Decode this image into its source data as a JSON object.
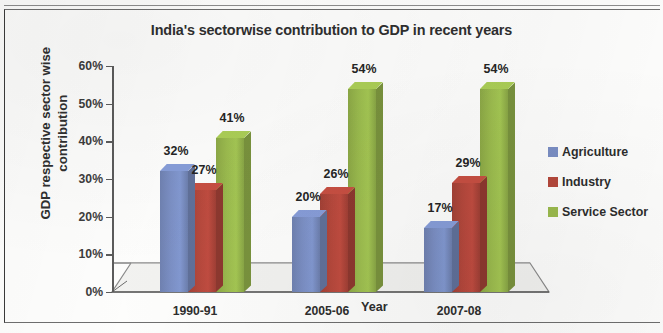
{
  "chart_data": {
    "type": "bar",
    "title": "India's sectorwise contribution to GDP in recent years",
    "xlabel": "Year",
    "ylabel_line1": "GDP respective sector wise",
    "ylabel_line2": "contribution",
    "categories": [
      "1990-91",
      "2005-06",
      "2007-08"
    ],
    "series": [
      {
        "name": "Agriculture",
        "color": "#7B8FC4",
        "values": [
          32,
          20,
          17
        ],
        "labels": [
          "32%",
          "20%",
          "17%"
        ]
      },
      {
        "name": "Industry",
        "color": "#B5483C",
        "values": [
          27,
          26,
          29
        ],
        "labels": [
          "27%",
          "26%",
          "29%"
        ]
      },
      {
        "name": "Service Sector",
        "color": "#9BBB4E",
        "values": [
          41,
          54,
          54
        ],
        "labels": [
          "41%",
          "54%",
          "54%"
        ]
      }
    ],
    "ylim": [
      0,
      60
    ],
    "ytick_values": [
      0,
      10,
      20,
      30,
      40,
      50,
      60
    ],
    "ytick_labels": [
      "0%",
      "10%",
      "20%",
      "30%",
      "40%",
      "50%",
      "60%"
    ],
    "grid": false,
    "legend_position": "right",
    "value_suffix": "%"
  },
  "legend": {
    "items": [
      {
        "label": "Agriculture",
        "color": "#7B8FC4"
      },
      {
        "label": "Industry",
        "color": "#B5483C"
      },
      {
        "label": "Service Sector",
        "color": "#9BBB4E"
      }
    ]
  }
}
